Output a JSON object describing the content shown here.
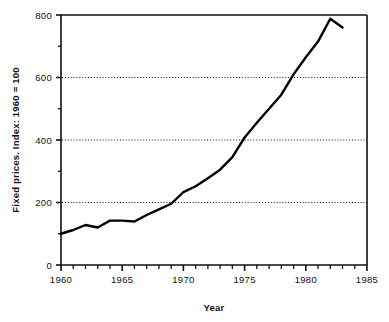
{
  "chart_data": {
    "type": "line",
    "title": "",
    "xlabel": "Year",
    "ylabel": "Fixed prices. Index: 1960 = 100",
    "xlim": [
      1960,
      1985
    ],
    "ylim": [
      0,
      800
    ],
    "grid": "horizontal dotted gridlines at 200, 400, 600",
    "legend": "none",
    "x_major_ticks": [
      1960,
      1965,
      1970,
      1975,
      1980,
      1985
    ],
    "x_tick_labels": [
      "1960",
      "1965",
      "1970",
      "1975",
      "1980",
      "1985"
    ],
    "x_minor_tick_step": 1,
    "y_major_ticks": [
      0,
      200,
      400,
      600,
      800
    ],
    "y_tick_labels": [
      "0",
      "200",
      "400",
      "600",
      "800"
    ],
    "y_minor_ticks": [
      100,
      300,
      500,
      700
    ],
    "gridlines": [
      200,
      400,
      600
    ],
    "line_color": "#000000",
    "line_width": 2.4,
    "x": [
      1960,
      1961,
      1962,
      1963,
      1964,
      1965,
      1966,
      1967,
      1968,
      1969,
      1970,
      1971,
      1972,
      1973,
      1974,
      1975,
      1976,
      1977,
      1978,
      1979,
      1980,
      1981,
      1982,
      1983
    ],
    "values": [
      100,
      112,
      128,
      120,
      142,
      142,
      139,
      160,
      178,
      196,
      233,
      252,
      278,
      305,
      345,
      408,
      455,
      500,
      545,
      610,
      665,
      715,
      788,
      760
    ],
    "series": [
      {
        "name": "Fixed prices index",
        "values": [
          100,
          112,
          128,
          120,
          142,
          142,
          139,
          160,
          178,
          196,
          233,
          252,
          278,
          305,
          345,
          408,
          455,
          500,
          545,
          610,
          665,
          715,
          788,
          760
        ]
      }
    ]
  },
  "axes": {
    "y_title": "Fixed prices. Index: 1960 = 100",
    "x_title": "Year"
  },
  "y_labels": [
    "800",
    "600",
    "400",
    "200",
    "0"
  ],
  "x_labels": [
    "1960",
    "1965",
    "1970",
    "1975",
    "1980",
    "1985"
  ]
}
